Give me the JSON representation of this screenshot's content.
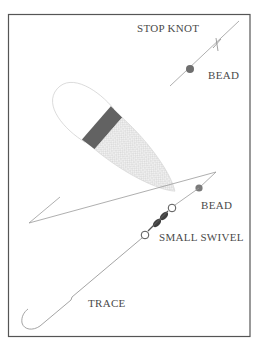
{
  "diagram": {
    "labels": {
      "stop_knot": "STOP KNOT",
      "bead_top": "BEAD",
      "bead_lower": "BEAD",
      "small_swivel": "SMALL SWIVEL",
      "trace": "TRACE"
    },
    "colors": {
      "line": "#9a9a9a",
      "border": "#555555",
      "bead": "#6e6e6e",
      "float_band": "#626262",
      "float_body": "#e8e8e8",
      "text": "#4a4a4a"
    }
  }
}
